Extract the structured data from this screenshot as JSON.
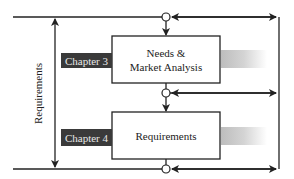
{
  "diagram": {
    "side_label": "Requirements",
    "stages": [
      {
        "chapter": "Chapter 3",
        "title_line1": "Needs &",
        "title_line2": "Market Analysis"
      },
      {
        "chapter": "Chapter 4",
        "title_line1": "Requirements",
        "title_line2": ""
      }
    ],
    "colors": {
      "line": "#222222",
      "chapter_bg": "#3a3a3a",
      "chapter_text": "#e8e8e8",
      "gradient_start": "#bdbdbd",
      "gradient_end": "#ffffff"
    }
  }
}
